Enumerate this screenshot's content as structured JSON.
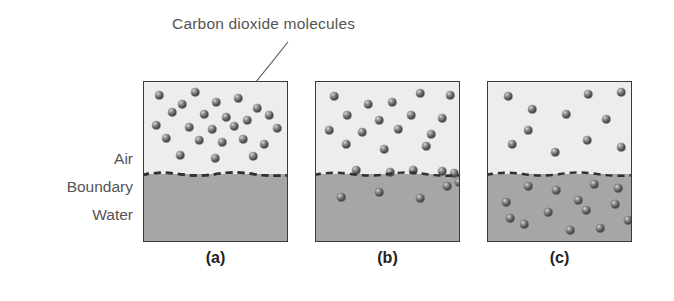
{
  "figure": {
    "callout": {
      "text": "Carbon dioxide molecules",
      "leader_line": "leader-line"
    },
    "row_labels": {
      "air": "Air",
      "boundary": "Boundary",
      "water": "Water"
    },
    "colors": {
      "air_fill": "#ededed",
      "water_fill": "#a6a6a6",
      "molecule": "#4e4e4e",
      "outline": "#3a3a3a",
      "text": "#545454",
      "background": "#ffffff"
    },
    "panels": [
      {
        "id": "a",
        "caption": "(a)",
        "air_count": 24,
        "boundary_count": 0,
        "water_count": 0,
        "air_molecules": [
          [
            15,
            13
          ],
          [
            38,
            22
          ],
          [
            51,
            10
          ],
          [
            72,
            20
          ],
          [
            94,
            16
          ],
          [
            113,
            26
          ],
          [
            28,
            30
          ],
          [
            60,
            32
          ],
          [
            82,
            35
          ],
          [
            103,
            38
          ],
          [
            125,
            33
          ],
          [
            12,
            43
          ],
          [
            45,
            45
          ],
          [
            68,
            47
          ],
          [
            90,
            44
          ],
          [
            133,
            46
          ],
          [
            22,
            56
          ],
          [
            55,
            58
          ],
          [
            78,
            60
          ],
          [
            99,
            57
          ],
          [
            120,
            62
          ],
          [
            36,
            73
          ],
          [
            71,
            76
          ],
          [
            109,
            74
          ]
        ],
        "water_molecules": []
      },
      {
        "id": "b",
        "caption": "(b)",
        "air_count": 16,
        "boundary_count": 5,
        "water_count": 5,
        "air_molecules": [
          [
            18,
            14
          ],
          [
            52,
            22
          ],
          [
            76,
            20
          ],
          [
            104,
            11
          ],
          [
            134,
            13
          ],
          [
            31,
            33
          ],
          [
            63,
            38
          ],
          [
            95,
            33
          ],
          [
            126,
            36
          ],
          [
            13,
            48
          ],
          [
            46,
            50
          ],
          [
            82,
            47
          ],
          [
            115,
            52
          ],
          [
            30,
            62
          ],
          [
            68,
            67
          ],
          [
            110,
            64
          ]
        ],
        "boundary_molecules": [
          [
            40,
            88
          ],
          [
            74,
            90
          ],
          [
            97,
            88
          ],
          [
            126,
            89
          ],
          [
            138,
            91
          ]
        ],
        "water_molecules": [
          [
            25,
            115
          ],
          [
            63,
            110
          ],
          [
            104,
            116
          ],
          [
            131,
            104
          ],
          [
            143,
            100
          ]
        ]
      },
      {
        "id": "c",
        "caption": "(c)",
        "air_count": 11,
        "boundary_count": 0,
        "water_count": 14,
        "air_molecules": [
          [
            20,
            14
          ],
          [
            100,
            12
          ],
          [
            133,
            10
          ],
          [
            44,
            27
          ],
          [
            78,
            32
          ],
          [
            118,
            37
          ],
          [
            40,
            48
          ],
          [
            24,
            62
          ],
          [
            67,
            70
          ],
          [
            99,
            58
          ],
          [
            133,
            65
          ]
        ],
        "water_molecules": [
          [
            40,
            104
          ],
          [
            68,
            108
          ],
          [
            106,
            102
          ],
          [
            130,
            106
          ],
          [
            18,
            120
          ],
          [
            90,
            118
          ],
          [
            127,
            122
          ],
          [
            60,
            130
          ],
          [
            98,
            128
          ],
          [
            36,
            142
          ],
          [
            82,
            148
          ],
          [
            112,
            146
          ],
          [
            22,
            136
          ],
          [
            140,
            138
          ]
        ]
      }
    ]
  }
}
